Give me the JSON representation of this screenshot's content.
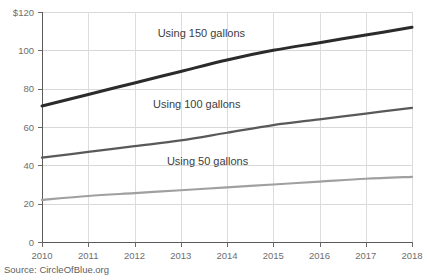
{
  "source_note": "Source: CircleOfBlue.org",
  "chart_data": {
    "type": "line",
    "title": "",
    "subtitle": "",
    "xlabel": "",
    "ylabel": "",
    "x": [
      2010,
      2011,
      2012,
      2013,
      2014,
      2015,
      2016,
      2017,
      2018
    ],
    "categories": [
      "2010",
      "2011",
      "2012",
      "2013",
      "2014",
      "2015",
      "2016",
      "2017",
      "2018"
    ],
    "xlim": [
      2010,
      2018
    ],
    "ylim": [
      0,
      120
    ],
    "yticks": [
      0,
      20,
      40,
      60,
      80,
      100,
      120
    ],
    "ytick_labels": [
      "0",
      "20",
      "40",
      "60",
      "80",
      "100",
      "$120"
    ],
    "xticks": [
      2010,
      2011,
      2012,
      2013,
      2014,
      2015,
      2016,
      2017,
      2018
    ],
    "xtick_labels": [
      "2010",
      "2011",
      "2012",
      "2013",
      "2014",
      "2015",
      "2016",
      "2017",
      "2018"
    ],
    "grid": true,
    "grid_axis": "both",
    "legend": "inline-annotations",
    "series": [
      {
        "name": "Using 150 gallons",
        "label": "Using 150 gallons",
        "color": "#2b2b2b",
        "width": 3,
        "values": [
          71,
          77,
          83,
          89,
          95,
          100,
          104,
          108,
          112
        ],
        "annotation": {
          "text": "Using 150 gallons",
          "x": 2012.5,
          "y": 107
        }
      },
      {
        "name": "Using 100 gallons",
        "label": "Using 100 gallons",
        "color": "#595959",
        "width": 2.2,
        "values": [
          44,
          47,
          50,
          53,
          57,
          61,
          64,
          67,
          70
        ],
        "annotation": {
          "text": "Using 100 gallons",
          "x": 2012.4,
          "y": 70
        }
      },
      {
        "name": "Using 50 gallons",
        "label": "Using 50 gallons",
        "color": "#a0a0a0",
        "width": 2.2,
        "values": [
          22,
          24,
          25.5,
          27,
          28.5,
          30,
          31.5,
          33,
          34
        ],
        "annotation": {
          "text": "Using 50 gallons",
          "x": 2012.7,
          "y": 40
        }
      }
    ]
  }
}
